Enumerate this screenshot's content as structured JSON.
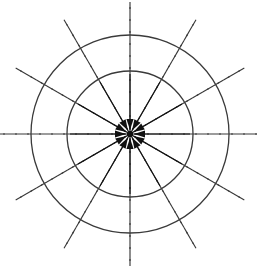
{
  "figure": {
    "title": "Radial convergence field diagram",
    "background_color": "#ffffff",
    "stroke_color": "#3a3a3a",
    "arrow_color": "#111111",
    "width": 257,
    "height": 268
  },
  "geometry": {
    "center_x": 130,
    "center_y": 134,
    "outer_radius": 99,
    "inner_radius": 63,
    "spoke_extent": 132,
    "arrow_start_radius": 60,
    "arrow_end_radius": 4,
    "arrow_head_length": 11,
    "arrow_head_halfwidth": 3.6,
    "center_dot_radius": 3.2,
    "circle_stroke_width": 1.3,
    "spoke_stroke_width": 1.15,
    "arrow_stroke_width": 1.05,
    "dash_pattern": "7 5"
  },
  "circles": [
    {
      "name": "outer-circle",
      "radius": 99,
      "style": "solid"
    },
    {
      "name": "inner-circle",
      "radius": 63,
      "style": "solid"
    }
  ],
  "spokes": {
    "count": 12,
    "step_degrees": 30,
    "style": "dashed",
    "angles_degrees": [
      0,
      30,
      60,
      90,
      120,
      150,
      180,
      210,
      240,
      270,
      300,
      330
    ]
  },
  "arrows": {
    "count": 12,
    "direction": "inward",
    "step_degrees": 30,
    "angles_degrees": [
      0,
      30,
      60,
      90,
      120,
      150,
      180,
      210,
      240,
      270,
      300,
      330
    ],
    "head_style": "filled-triangle"
  },
  "chart_data": {
    "type": "scatter",
    "title": "Radial convergence field diagram",
    "xlabel": "",
    "ylabel": "",
    "grid": false,
    "legend": "none",
    "categories": [
      "0°",
      "30°",
      "60°",
      "90°",
      "120°",
      "150°",
      "180°",
      "210°",
      "240°",
      "270°",
      "300°",
      "330°"
    ],
    "values": [
      1,
      1,
      1,
      1,
      1,
      1,
      1,
      1,
      1,
      1,
      1,
      1
    ],
    "series": [
      {
        "name": "inner-circle-radius",
        "values": [
          63,
          63,
          63,
          63,
          63,
          63,
          63,
          63,
          63,
          63,
          63,
          63
        ]
      },
      {
        "name": "outer-circle-radius",
        "values": [
          99,
          99,
          99,
          99,
          99,
          99,
          99,
          99,
          99,
          99,
          99,
          99
        ]
      },
      {
        "name": "spoke-extent-radius",
        "values": [
          132,
          132,
          132,
          132,
          132,
          132,
          132,
          132,
          132,
          132,
          132,
          132
        ]
      },
      {
        "name": "arrow-magnitude-inward",
        "values": [
          56,
          56,
          56,
          56,
          56,
          56,
          56,
          56,
          56,
          56,
          56,
          56
        ]
      }
    ]
  }
}
